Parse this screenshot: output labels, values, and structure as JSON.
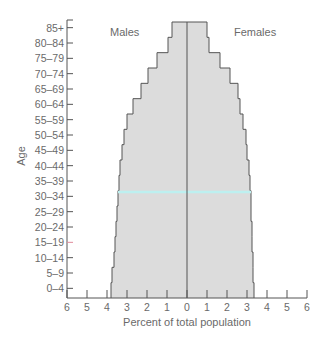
{
  "chart_data": {
    "type": "bar",
    "subtype": "population-pyramid",
    "title": "",
    "xlabel": "Percent of total population",
    "ylabel": "Age",
    "categories": [
      "0–4",
      "5–9",
      "10–14",
      "15–19",
      "20–24",
      "25–29",
      "30–34",
      "35–39",
      "40–44",
      "45–49",
      "50–54",
      "55–59",
      "60–64",
      "65–69",
      "70–74",
      "75–79",
      "80–84",
      "85+"
    ],
    "series": [
      {
        "name": "Males",
        "side": "left",
        "values": [
          3.8,
          3.75,
          3.65,
          3.6,
          3.55,
          3.5,
          3.45,
          3.4,
          3.35,
          3.25,
          3.15,
          3.0,
          2.7,
          2.3,
          1.95,
          1.5,
          0.95,
          0.75
        ]
      },
      {
        "name": "Females",
        "side": "right",
        "values": [
          3.35,
          3.3,
          3.3,
          3.25,
          3.25,
          3.2,
          3.2,
          3.15,
          3.1,
          3.0,
          2.95,
          2.8,
          2.65,
          2.55,
          2.15,
          1.65,
          1.1,
          1.0
        ]
      }
    ],
    "xticks": [
      "6",
      "5",
      "4",
      "3",
      "2",
      "1",
      "0",
      "1",
      "2",
      "3",
      "4",
      "5",
      "6"
    ],
    "xlim": [
      -6,
      6
    ],
    "legend": {
      "left_label": "Males",
      "right_label": "Females",
      "position": "top-inside"
    },
    "grid": false,
    "colors": {
      "fill": "#dcdcdc",
      "edge": "#555555",
      "axis": "#555555",
      "text": "#6a6a6a",
      "highlight": "#bdf0f0",
      "tick_highlight": "#e08a9a"
    },
    "annotations": [
      "cyan highlight line near 30–34 row",
      "15–19 tick highlighted red"
    ]
  }
}
